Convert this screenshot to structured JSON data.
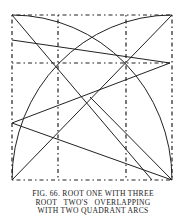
{
  "figure": {
    "caption_lines": [
      "FIG. 66.  ROOT ONE WITH THREE",
      "ROOT   TWO'S   OVERLAPPING",
      "WITH TWO QUADRANT ARCS"
    ],
    "square": {
      "x1": 12,
      "y1": 15,
      "x2": 172,
      "y2": 180
    },
    "dashed_verticals_x": [
      58,
      126
    ],
    "dashed_horizontal_y": 63,
    "ink_color": "#222222"
  }
}
